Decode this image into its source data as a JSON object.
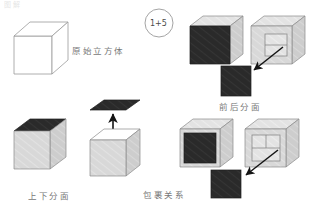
{
  "page": {
    "width": 322,
    "height": 211,
    "background": "#ffffff",
    "top_clipped_text": "图解"
  },
  "colors": {
    "dark_face": "#2a2a2a",
    "dark_face_alt": "#262626",
    "light_face": "#d8d8d8",
    "light_face_top": "#e4e4e4",
    "light_face_side": "#cfcfcf",
    "outline": "#8a8a8a",
    "outline_soft": "#a8a8a8",
    "arrow": "#141414",
    "text": "#5a5a5a"
  },
  "annotations": {
    "badge_circle_text": "1+5"
  },
  "labels": {
    "original_cube": "原始立方体",
    "front_back_faces": "前后分面",
    "top_bottom_faces": "上下分面",
    "wrapping_relation": "包裹关系"
  },
  "panels": [
    {
      "id": "original-cube",
      "label": "原始立方体",
      "description": "wireframe outline cube, no shaded faces"
    },
    {
      "id": "front-back-faces",
      "label": "前后分面",
      "description": "solid cube with dark front face, open cube with inner square and arrow to detached dark square"
    },
    {
      "id": "top-bottom-faces",
      "label": "上下分面",
      "description": "solid cube with dark top face, open cube with dark top face lifted and upward arrow"
    },
    {
      "id": "wrapping-relation",
      "label": "包裹关系",
      "description": "cube with inset dark front face, wireframe cube with arrow to detached dark square"
    }
  ]
}
